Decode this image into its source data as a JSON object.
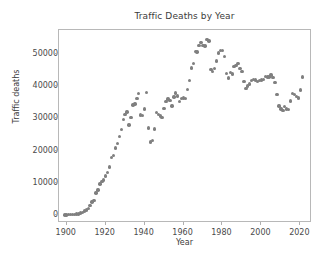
{
  "chart_data": {
    "type": "scatter",
    "title": "Traffic Deaths by Year",
    "xlabel": "Year",
    "ylabel": "Traffic deaths",
    "grid": false,
    "legend": null,
    "legend_position": "none",
    "marker_color": "#7f7f7f",
    "marker": "circle",
    "xlim": [
      1896,
      2026
    ],
    "ylim": [
      -2500,
      57500
    ],
    "xticks": [
      1900,
      1920,
      1940,
      1960,
      1980,
      2000,
      2020
    ],
    "xtick_labels": [
      "1900",
      "1920",
      "1940",
      "1960",
      "1980",
      "2000",
      "2020"
    ],
    "yticks": [
      0,
      10000,
      20000,
      30000,
      40000,
      50000
    ],
    "ytick_labels": [
      "0",
      "10000",
      "20000",
      "30000",
      "40000",
      "50000"
    ],
    "x": [
      1899,
      1900,
      1901,
      1902,
      1903,
      1904,
      1905,
      1906,
      1907,
      1908,
      1909,
      1910,
      1911,
      1912,
      1913,
      1914,
      1915,
      1916,
      1917,
      1918,
      1919,
      1920,
      1921,
      1922,
      1923,
      1924,
      1925,
      1926,
      1927,
      1928,
      1929,
      1930,
      1931,
      1932,
      1933,
      1934,
      1935,
      1936,
      1937,
      1938,
      1939,
      1940,
      1941,
      1942,
      1943,
      1944,
      1945,
      1946,
      1947,
      1948,
      1949,
      1950,
      1951,
      1952,
      1953,
      1954,
      1955,
      1956,
      1957,
      1958,
      1959,
      1960,
      1961,
      1962,
      1963,
      1964,
      1965,
      1966,
      1967,
      1968,
      1969,
      1970,
      1971,
      1972,
      1973,
      1974,
      1975,
      1976,
      1977,
      1978,
      1979,
      1980,
      1981,
      1982,
      1983,
      1984,
      1985,
      1986,
      1987,
      1988,
      1989,
      1990,
      1991,
      1992,
      1993,
      1994,
      1995,
      1996,
      1997,
      1998,
      1999,
      2000,
      2001,
      2002,
      2003,
      2004,
      2005,
      2006,
      2007,
      2008,
      2009,
      2010,
      2011,
      2012,
      2013,
      2014,
      2015,
      2016,
      2017,
      2018,
      2019,
      2020,
      2021
    ],
    "y": [
      26,
      36,
      54,
      79,
      117,
      172,
      252,
      338,
      581,
      751,
      1174,
      1599,
      2043,
      2968,
      4079,
      4468,
      6779,
      7766,
      9630,
      10390,
      10896,
      12155,
      13253,
      14859,
      17870,
      18400,
      20771,
      22194,
      24470,
      26557,
      29592,
      31204,
      31963,
      27979,
      30296,
      34240,
      34494,
      36126,
      37819,
      31083,
      30895,
      32914,
      38142,
      27007,
      22727,
      23165,
      26785,
      31874,
      31193,
      30775,
      30246,
      33186,
      35309,
      36088,
      35586,
      33890,
      36688,
      37965,
      36932,
      35331,
      36223,
      36399,
      36285,
      38980,
      41723,
      45645,
      47089,
      50894,
      50724,
      52725,
      53543,
      52627,
      52542,
      54589,
      54052,
      45196,
      44525,
      45523,
      47878,
      50331,
      51093,
      51091,
      49301,
      43945,
      42589,
      44257,
      43825,
      46087,
      46390,
      47087,
      45582,
      44599,
      41508,
      39250,
      40150,
      40716,
      41817,
      42065,
      42013,
      41501,
      41717,
      41945,
      42196,
      43005,
      42884,
      42836,
      43510,
      42708,
      41259,
      37423,
      33883,
      32999,
      32479,
      33782,
      32893,
      32744,
      35485,
      37806,
      37473,
      36835,
      36355,
      38824,
      42939
    ]
  }
}
